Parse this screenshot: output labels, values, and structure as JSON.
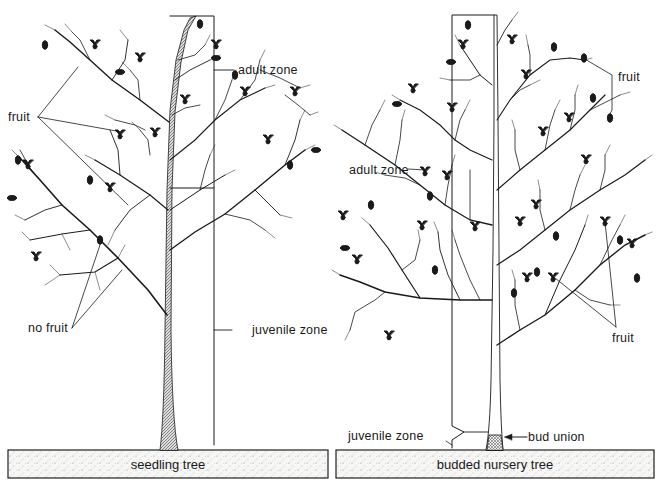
{
  "figure": {
    "left_tree": {
      "ground_label": "seedling tree",
      "labels": {
        "adult_zone": "adult zone",
        "fruit": "fruit",
        "no_fruit": "no fruit",
        "juvenile_zone": "juvenile zone"
      }
    },
    "right_tree": {
      "ground_label": "budded nursery tree",
      "labels": {
        "fruit_top": "fruit",
        "adult_zone": "adult zone",
        "fruit_bottom": "fruit",
        "juvenile_zone": "juvenile zone",
        "bud_union": "bud union"
      }
    }
  },
  "colors": {
    "ink": "#1a1a1a",
    "ground_fill": "#f4f4f2",
    "background": "#ffffff"
  }
}
